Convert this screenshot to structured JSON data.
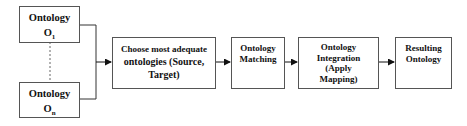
{
  "diagram": {
    "sources": [
      {
        "label": "Ontology",
        "sub": "O",
        "subscript": "1"
      },
      {
        "label": "Ontology",
        "sub": "O",
        "subscript": "n"
      }
    ],
    "steps": [
      {
        "line1": "Choose most adequate",
        "line2": "ontologies (Source,",
        "line3": "Target)"
      },
      {
        "line1": "Ontology",
        "line2": "Matching"
      },
      {
        "line1": "Ontology",
        "line2": "Integration",
        "line3": "(Apply",
        "line4": "Mapping)"
      },
      {
        "line1": "Resulting",
        "line2": "Ontology"
      }
    ]
  }
}
